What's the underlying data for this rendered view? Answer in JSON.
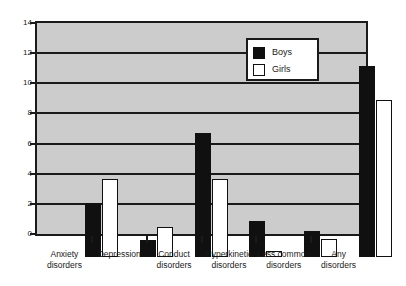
{
  "chart_data": {
    "type": "bar",
    "title": "",
    "subtitle": "",
    "xlabel": "",
    "ylabel": "",
    "ylim": [
      0,
      14
    ],
    "ytick_step": 2,
    "yticks": [
      "0",
      "2",
      "4",
      "6",
      "8",
      "10",
      "12",
      "14"
    ],
    "grid": true,
    "legend_position": "top-center-right",
    "categories": [
      "Anxiety\ndisorders",
      "Depression",
      "Conduct\ndisorders",
      "Hyperkinetic\ndisorders",
      "Less common\ndisorders",
      "Any\ndisorders"
    ],
    "series": [
      {
        "name": "Boys",
        "color": "#101010",
        "values": [
          3.6,
          1.1,
          8.2,
          2.4,
          1.7,
          12.7
        ]
      },
      {
        "name": "Girls",
        "color": "#ffffff",
        "values": [
          5.2,
          2.0,
          5.2,
          0.4,
          1.2,
          10.4
        ]
      }
    ]
  },
  "style": {
    "plot_background": "#cccccc",
    "page_background": "#ffffff",
    "axis_color": "#1a1a1a",
    "boys_color": "#101010",
    "girls_color": "#ffffff"
  }
}
